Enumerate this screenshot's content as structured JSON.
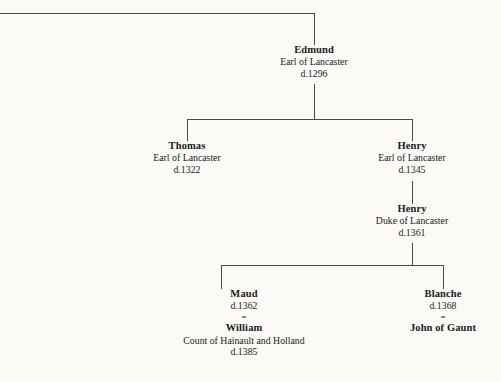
{
  "chart": {
    "type": "genealogy-tree",
    "background_color": "#fbfaf7",
    "line_color": "#4a4a4a",
    "marriage_symbol": "="
  },
  "nodes": {
    "edmund": {
      "name": "Edmund",
      "title": "Earl of Lancaster",
      "death": "d.1296"
    },
    "thomas": {
      "name": "Thomas",
      "title": "Earl of Lancaster",
      "death": "d.1322"
    },
    "henry_earl": {
      "name": "Henry",
      "title": "Earl of Lancaster",
      "death": "d.1345"
    },
    "henry_duke": {
      "name": "Henry",
      "title": "Duke of Lancaster",
      "death": "d.1361"
    },
    "maud": {
      "name": "Maud",
      "death": "d.1362",
      "marriage": "=",
      "spouse_name": "William",
      "spouse_title": "Count of Hainault and Holland",
      "spouse_death": "d.1385"
    },
    "blanche": {
      "name": "Blanche",
      "death": "d.1368",
      "marriage": "=",
      "spouse_name": "John of Gaunt"
    }
  }
}
